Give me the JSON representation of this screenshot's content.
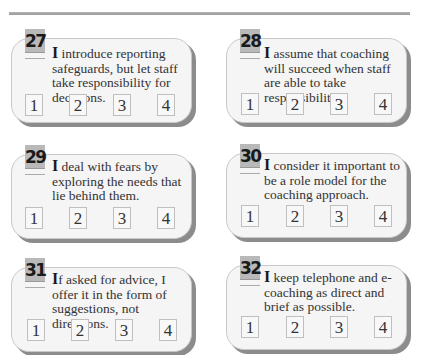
{
  "page": {
    "rating_scale": [
      "1",
      "2",
      "3",
      "4"
    ]
  },
  "questions": [
    {
      "number": "27",
      "first_letter": "I",
      "text": " introduce reporting safeguards, but let staff take responsibility for decisions."
    },
    {
      "number": "28",
      "first_letter": "I",
      "text": " assume that coaching will succeed when staff are able to take responsibility."
    },
    {
      "number": "29",
      "first_letter": "I",
      "text": " deal with fears by exploring the needs that lie behind them."
    },
    {
      "number": "30",
      "first_letter": "I",
      "text": " consider it important to be a role model for the coaching approach."
    },
    {
      "number": "31",
      "first_letter": "I",
      "text": "f asked for advice, I offer it in the form of suggestions, not directions."
    },
    {
      "number": "32",
      "first_letter": "I",
      "text": " keep telephone and e-coaching as direct and brief as possible."
    }
  ],
  "colors": {
    "badge": "#b9b9b9",
    "card_bg": "#f5f5f5",
    "card_shadow": "#8c8c8c",
    "rule": "#a8a8a8"
  }
}
